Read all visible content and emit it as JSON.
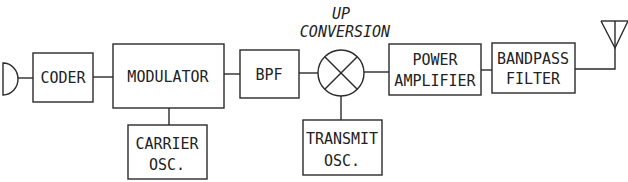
{
  "diagram": {
    "type": "block-diagram",
    "title": "",
    "colors": {
      "stroke": "#2a2a2a",
      "text": "#222222",
      "background": "#ffffff"
    },
    "nodes": [
      {
        "id": "microphone",
        "shape": "half-circle",
        "label": ""
      },
      {
        "id": "coder",
        "shape": "rect",
        "lines": [
          "CODER"
        ]
      },
      {
        "id": "modulator",
        "shape": "rect",
        "lines": [
          "MODULATOR"
        ]
      },
      {
        "id": "carrier_osc",
        "shape": "rect",
        "lines": [
          "CARRIER",
          "OSC."
        ]
      },
      {
        "id": "bpf",
        "shape": "rect",
        "lines": [
          "BPF"
        ]
      },
      {
        "id": "mixer",
        "shape": "circle-x",
        "lines": [
          "UP",
          "CONVERSION"
        ]
      },
      {
        "id": "transmit_osc",
        "shape": "rect",
        "lines": [
          "TRANSMIT",
          "OSC."
        ]
      },
      {
        "id": "power_amplifier",
        "shape": "rect",
        "lines": [
          "POWER",
          "AMPLIFIER"
        ]
      },
      {
        "id": "bandpass_filter",
        "shape": "rect",
        "lines": [
          "BANDPASS",
          "FILTER"
        ]
      },
      {
        "id": "antenna",
        "shape": "antenna",
        "label": ""
      }
    ],
    "edges": [
      {
        "from": "microphone",
        "to": "coder"
      },
      {
        "from": "coder",
        "to": "modulator"
      },
      {
        "from": "carrier_osc",
        "to": "modulator"
      },
      {
        "from": "modulator",
        "to": "bpf"
      },
      {
        "from": "bpf",
        "to": "mixer"
      },
      {
        "from": "transmit_osc",
        "to": "mixer"
      },
      {
        "from": "mixer",
        "to": "power_amplifier"
      },
      {
        "from": "power_amplifier",
        "to": "bandpass_filter"
      },
      {
        "from": "bandpass_filter",
        "to": "antenna"
      }
    ]
  },
  "labels": {
    "coder": "CODER",
    "modulator": "MODULATOR",
    "carrier_osc_1": "CARRIER",
    "carrier_osc_2": "OSC.",
    "bpf": "BPF",
    "up_conversion_1": "UP",
    "up_conversion_2": "CONVERSION",
    "transmit_osc_1": "TRANSMIT",
    "transmit_osc_2": "OSC.",
    "power_amp_1": "POWER",
    "power_amp_2": "AMPLIFIER",
    "bandpass_1": "BANDPASS",
    "bandpass_2": "FILTER"
  }
}
